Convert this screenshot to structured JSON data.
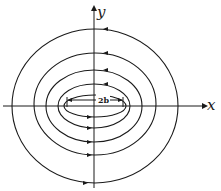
{
  "diagram": {
    "type": "field-lines-around-strip",
    "axes": {
      "x_label": "x",
      "y_label": "y"
    },
    "dimension_label": "2b",
    "circulation": "counterclockwise",
    "line_count": 5,
    "colors": {
      "stroke": "#1a1a1a",
      "background": "#ffffff"
    }
  }
}
